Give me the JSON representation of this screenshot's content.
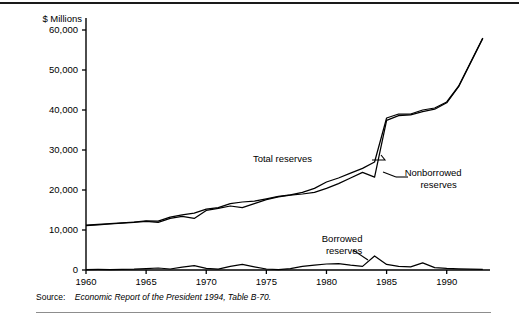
{
  "figure": {
    "y_axis_title": "$ Millions",
    "source_word": "Source:",
    "source_text": "Economic Report of the President 1994, Table B-70.",
    "rule_color": "#1a1a1a",
    "line_color": "#000000"
  },
  "chart_data": {
    "type": "line",
    "title": "",
    "xlabel": "",
    "ylabel": "$ Millions",
    "xlim": [
      1960,
      1993
    ],
    "ylim": [
      0,
      63000
    ],
    "grid": false,
    "legend": "inline-annotations",
    "xticks": [
      1960,
      1965,
      1970,
      1975,
      1980,
      1985,
      1990
    ],
    "xtick_labels": [
      "1960",
      "1965",
      "1970",
      "1975",
      "1980",
      "1985",
      "1990"
    ],
    "yticks": [
      0,
      10000,
      20000,
      30000,
      40000,
      50000,
      60000
    ],
    "ytick_labels": [
      "0",
      "10,000",
      "20,000",
      "30,000",
      "40,000",
      "50,000",
      "60,000"
    ],
    "x": [
      1960,
      1961,
      1962,
      1963,
      1964,
      1965,
      1966,
      1967,
      1968,
      1969,
      1970,
      1971,
      1972,
      1973,
      1974,
      1975,
      1976,
      1977,
      1978,
      1979,
      1980,
      1981,
      1982,
      1983,
      1984,
      1985,
      1986,
      1987,
      1988,
      1989,
      1990,
      1991,
      1992,
      1993
    ],
    "series": [
      {
        "name": "Total reserves",
        "label": "Total reserves",
        "values": [
          11200,
          11400,
          11600,
          11800,
          12000,
          12300,
          12200,
          13200,
          13800,
          14200,
          15200,
          15600,
          16600,
          17000,
          17200,
          17800,
          18400,
          18800,
          19400,
          20400,
          22000,
          23000,
          24200,
          25400,
          27000,
          38000,
          39000,
          39000,
          40000,
          40500,
          42000,
          46000,
          52000,
          58000
        ]
      },
      {
        "name": "Nonborrowed reserves",
        "label": "Nonborrowed reserves",
        "values": [
          11100,
          11300,
          11500,
          11700,
          11900,
          12150,
          11900,
          12900,
          13400,
          12900,
          14900,
          15400,
          16000,
          15600,
          16600,
          17600,
          18300,
          18700,
          19000,
          19400,
          20400,
          21600,
          23000,
          24400,
          23200,
          37400,
          38600,
          38800,
          39600,
          40200,
          41800,
          45900,
          51900,
          57900
        ]
      },
      {
        "name": "Borrowed reserves",
        "label": "Borrowed reserves",
        "values": [
          100,
          130,
          110,
          180,
          230,
          350,
          500,
          250,
          700,
          1100,
          400,
          200,
          900,
          1400,
          800,
          250,
          100,
          350,
          900,
          1200,
          1500,
          1600,
          1200,
          900,
          3500,
          1400,
          900,
          800,
          1800,
          600,
          400,
          300,
          200,
          150
        ]
      }
    ],
    "annotations": [
      {
        "text": "Total reserves",
        "x": 1978.8,
        "y": 27000
      },
      {
        "text": "Nonborrowed reserves",
        "x": 1986.5,
        "y": 23500
      },
      {
        "text": "Borrowed reserves",
        "x": 1981.3,
        "y": 7000
      }
    ]
  }
}
